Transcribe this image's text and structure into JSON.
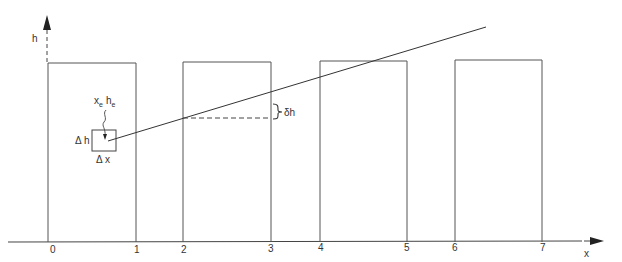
{
  "diagram": {
    "axes": {
      "x_label": "x",
      "y_label": "h",
      "x_ticks": [
        "0",
        "1",
        "2",
        "3",
        "4",
        "5",
        "6",
        "7"
      ]
    },
    "element_label": {
      "x": "x",
      "x_sub": "e",
      "h": "h",
      "h_sub": "e"
    },
    "cell": {
      "dh_label": "Δ h",
      "dx_label": "Δ x"
    },
    "offset_label": "δh",
    "colors": {
      "stroke": "#333333",
      "background": "#ffffff"
    }
  }
}
